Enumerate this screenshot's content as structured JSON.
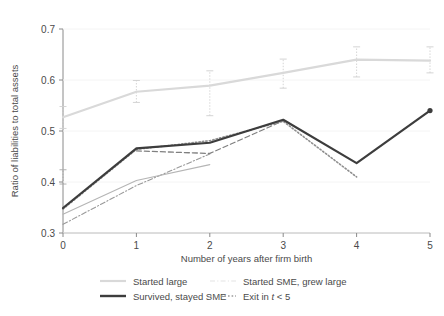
{
  "chart_data": {
    "type": "line",
    "title": "",
    "xlabel": "Number of years after firm birth",
    "ylabel": "Ratio of liabilities to total assets",
    "xlim": [
      0,
      5
    ],
    "ylim": [
      0.3,
      0.7
    ],
    "xticks": [
      "0",
      "1",
      "2",
      "3",
      "4",
      "5"
    ],
    "yticks": [
      "0.3",
      "0.4",
      "0.5",
      "0.6",
      "0.7"
    ],
    "x": [
      0,
      1,
      2,
      3,
      4,
      5
    ],
    "grid": false,
    "legend_position": "bottom",
    "series": [
      {
        "name": "Started large",
        "key": "started_large",
        "color": "#d9d9d9",
        "style": "solid",
        "width": 2.2,
        "x": [
          0,
          1,
          2,
          3,
          4,
          5
        ],
        "values": [
          0.527,
          0.577,
          0.589,
          0.614,
          0.64,
          0.638
        ],
        "err_low": [
          0.505,
          0.556,
          0.53,
          0.584,
          0.606,
          0.614
        ],
        "err_high": [
          0.548,
          0.599,
          0.618,
          0.641,
          0.665,
          0.665
        ]
      },
      {
        "name": "Started SME, grew large",
        "key": "started_sme_grew_large",
        "color": "#b5b5b5",
        "style": "solid",
        "width": 1.1,
        "x": [
          0,
          1,
          2
        ],
        "values": [
          0.337,
          0.403,
          0.434
        ],
        "err_low": [],
        "err_high": []
      },
      {
        "name": "Survived, stayed SME",
        "key": "survived_stayed_sme",
        "color": "#3d3d3d",
        "style": "solid",
        "width": 2.2,
        "x": [
          0,
          1,
          2,
          3,
          4,
          5
        ],
        "values": [
          0.349,
          0.466,
          0.477,
          0.522,
          0.437,
          0.54
        ],
        "err_low": [],
        "err_high": []
      },
      {
        "name": "Exit in t < 5",
        "key": "exit_in_t_lt_5",
        "color": "#8f8f8f",
        "style": "dotted",
        "width": 1.6,
        "x": [
          0,
          1,
          2,
          3,
          4
        ],
        "values": [
          0.347,
          0.464,
          0.481,
          0.519,
          0.41
        ],
        "err_low": [],
        "err_high": []
      },
      {
        "name": "dashdot-lower",
        "key": "dashdot_lower",
        "color": "#9a9a9a",
        "style": "dashdot",
        "width": 1.1,
        "x": [
          0,
          1,
          2
        ],
        "values": [
          0.317,
          0.393,
          0.455
        ],
        "err_low": [],
        "err_high": []
      },
      {
        "name": "dashed-mid",
        "key": "dashed_mid",
        "color": "#808080",
        "style": "dashed",
        "width": 1.3,
        "x": [
          1,
          2,
          3
        ],
        "values": [
          0.461,
          0.456,
          0.52
        ],
        "err_low": [],
        "err_high": []
      }
    ],
    "errorbars_note": "Started large series shows vertical whisker error bars at each x",
    "errorbar_color": "#cfcfcf",
    "errorbar_color_dark": "#a8a8a8",
    "lower_errorbars": [
      {
        "x": 0,
        "low": 0.396,
        "high": 0.424
      }
    ]
  },
  "legend": {
    "entries": [
      {
        "label": "Started large",
        "marker": "solid-light",
        "color": "#d9d9d9"
      },
      {
        "label": "Started SME, grew large",
        "marker": "solid-faint",
        "color": "#ededed"
      },
      {
        "label": "Survived, stayed SME",
        "marker": "solid-dark",
        "color": "#3d3d3d"
      },
      {
        "label": "Exit in ",
        "label_italic": "t",
        "label_tail": " < 5",
        "marker": "dotted",
        "color": "#9a9a9a"
      }
    ]
  },
  "axes": {
    "spine_color": "#8a8a8a",
    "text_color": "#4a4a4a"
  }
}
